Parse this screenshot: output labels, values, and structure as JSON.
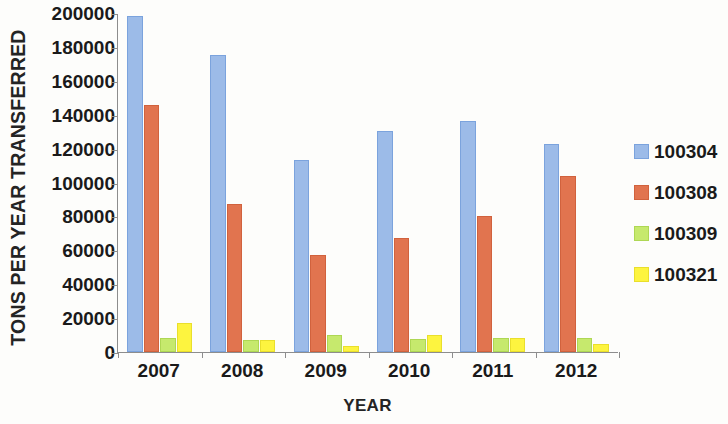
{
  "chart_data": {
    "type": "bar",
    "title": "",
    "xlabel": "YEAR",
    "ylabel": "TONS PER YEAR TRANSFERRED",
    "categories": [
      "2007",
      "2008",
      "2009",
      "2010",
      "2011",
      "2012"
    ],
    "ylim": [
      0,
      200000
    ],
    "yticks": [
      0,
      20000,
      40000,
      60000,
      80000,
      100000,
      120000,
      140000,
      160000,
      180000,
      200000
    ],
    "ytick_labels": [
      "0",
      "20000",
      "40000",
      "60000",
      "80000",
      "100000",
      "120000",
      "140000",
      "160000",
      "180000",
      "200000"
    ],
    "grid": false,
    "legend_position": "right",
    "series": [
      {
        "name": "100304",
        "color": "#9cbbe8",
        "values": [
          198000,
          175000,
          113500,
          130500,
          136000,
          123000
        ]
      },
      {
        "name": "100308",
        "color": "#e1744f",
        "values": [
          146000,
          87500,
          57000,
          67500,
          80000,
          104000
        ]
      },
      {
        "name": "100309",
        "color": "#c6e96d",
        "values": [
          8000,
          7000,
          10000,
          7500,
          8500,
          8000
        ]
      },
      {
        "name": "100321",
        "color": "#fdf43f",
        "values": [
          17000,
          7000,
          3500,
          10000,
          8000,
          4500
        ]
      }
    ]
  },
  "axis": {
    "y_title": "TONS PER YEAR TRANSFERRED",
    "x_title": "YEAR"
  },
  "legend": {
    "items": [
      {
        "label": "100304"
      },
      {
        "label": "100308"
      },
      {
        "label": "100309"
      },
      {
        "label": "100321"
      }
    ]
  }
}
